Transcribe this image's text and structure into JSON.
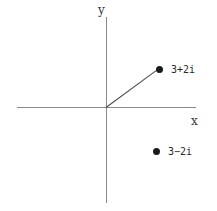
{
  "figure": {
    "background_color": "#ffffff",
    "axis_color": "#8a8a8a",
    "line_color": "#4a4a4a",
    "point_color": "#1a1a1a",
    "text_color": "#2b2b2b"
  },
  "axes": {
    "x_label": "x",
    "y_label": "y"
  },
  "chart_data": {
    "type": "scatter",
    "title": "",
    "xlabel": "x",
    "ylabel": "y",
    "grid": false,
    "legend": false,
    "xlim": [
      -3.5,
      5.2
    ],
    "ylim": [
      -5.2,
      5.2
    ],
    "points": [
      {
        "label": "3+2i",
        "x": 3,
        "y": 2,
        "connected_to_origin": true
      },
      {
        "label": "3-2i",
        "x": 3,
        "y": -2,
        "connected_to_origin": false
      }
    ],
    "annotations": [
      {
        "text": "3+2i",
        "x": 3,
        "y": 2
      },
      {
        "text": "3-2i",
        "x": 3,
        "y": -2
      }
    ],
    "segments": [
      {
        "from": [
          0,
          0
        ],
        "to": [
          3,
          2
        ]
      }
    ]
  },
  "labels": {
    "upper_point": "3+2i",
    "lower_point": "3−2i"
  }
}
